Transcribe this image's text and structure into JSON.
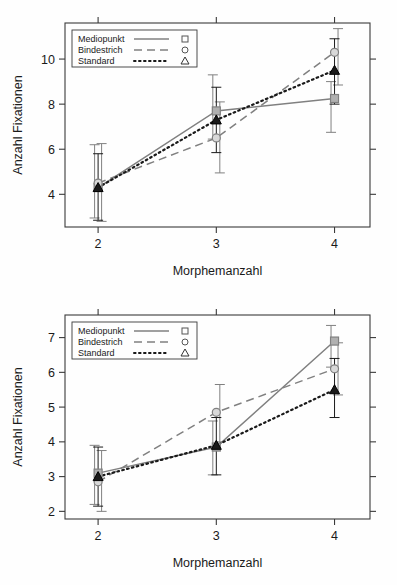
{
  "figure": {
    "title": "",
    "panel_count": 2
  },
  "chart_data": [
    {
      "id": "top",
      "type": "line",
      "title": "",
      "subtitle": "",
      "xlabel": "Morphemanzahl",
      "ylabel": "Anzahl Fixationen",
      "x": [
        2,
        3,
        4
      ],
      "categories": [
        "2",
        "3",
        "4"
      ],
      "xtick_labels": [
        "2",
        "3",
        "4"
      ],
      "ytick_labels": [
        "4",
        "6",
        "8",
        "10"
      ],
      "yticks": [
        4,
        6,
        8,
        10
      ],
      "xlim": [
        1.72,
        4.3
      ],
      "ylim": [
        2.55,
        11.6
      ],
      "grid": false,
      "legend_position": "top-left",
      "error_bars": "95% CI",
      "series": [
        {
          "name": "Mediopunkt",
          "marker": "square",
          "linestyle": "solid",
          "color": "#808080",
          "values": [
            4.3,
            7.7,
            8.25
          ],
          "err_low": [
            2.95,
            6.45,
            6.75
          ],
          "err_high": [
            6.2,
            9.3,
            9.0
          ]
        },
        {
          "name": "Bindestrich",
          "marker": "circle",
          "linestyle": "dashed",
          "color": "#808080",
          "values": [
            4.5,
            6.5,
            10.3
          ],
          "err_low": [
            2.8,
            4.95,
            8.85
          ],
          "err_high": [
            6.25,
            8.1,
            11.35
          ]
        },
        {
          "name": "Standard",
          "marker": "triangle",
          "linestyle": "dotted",
          "color": "#1a1a1a",
          "values": [
            4.3,
            7.3,
            9.5
          ],
          "err_low": [
            2.85,
            5.85,
            8.0
          ],
          "err_high": [
            5.8,
            8.75,
            10.9
          ]
        }
      ]
    },
    {
      "id": "bottom",
      "type": "line",
      "title": "",
      "subtitle": "",
      "xlabel": "Morphemanzahl",
      "ylabel": "Anzahl Fixationen",
      "x": [
        2,
        3,
        4
      ],
      "categories": [
        "2",
        "3",
        "4"
      ],
      "xtick_labels": [
        "2",
        "3",
        "4"
      ],
      "ytick_labels": [
        "2",
        "3",
        "4",
        "5",
        "6",
        "7"
      ],
      "yticks": [
        2,
        3,
        4,
        5,
        6,
        7
      ],
      "xlim": [
        1.72,
        4.3
      ],
      "ylim": [
        1.78,
        7.65
      ],
      "grid": false,
      "legend_position": "top-left",
      "error_bars": "95% CI",
      "series": [
        {
          "name": "Mediopunkt",
          "marker": "square",
          "linestyle": "solid",
          "color": "#808080",
          "values": [
            3.1,
            3.85,
            6.9
          ],
          "err_low": [
            2.2,
            3.05,
            6.15
          ],
          "err_high": [
            3.9,
            4.6,
            7.35
          ]
        },
        {
          "name": "Bindestrich",
          "marker": "circle",
          "linestyle": "dashed",
          "color": "#808080",
          "values": [
            2.85,
            4.85,
            6.1
          ],
          "err_low": [
            2.0,
            4.0,
            5.35
          ],
          "err_high": [
            3.75,
            5.65,
            6.85
          ]
        },
        {
          "name": "Standard",
          "marker": "triangle",
          "linestyle": "dotted",
          "color": "#1a1a1a",
          "values": [
            3.0,
            3.9,
            5.5
          ],
          "err_low": [
            2.15,
            3.05,
            4.7
          ],
          "err_high": [
            3.85,
            4.7,
            6.4
          ]
        }
      ]
    }
  ],
  "colors": {
    "gray_series": "#808080",
    "black_series": "#1a1a1a",
    "frame": "#3a3a3a",
    "background": "#ffffff"
  }
}
